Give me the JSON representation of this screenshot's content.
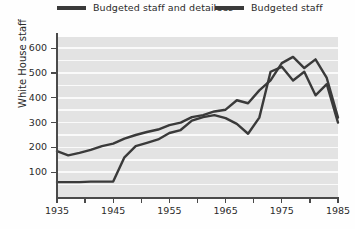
{
  "chart_data": {
    "type": "line",
    "title": "",
    "xlabel": "",
    "ylabel": "White House staff",
    "xlim": [
      1935,
      1985
    ],
    "ylim": [
      0,
      650
    ],
    "xticks": [
      1935,
      1945,
      1955,
      1965,
      1975,
      1985
    ],
    "xtick_labels": [
      "1935",
      "1945",
      "1955",
      "1965",
      "1975",
      "1985"
    ],
    "yticks": [
      100,
      200,
      300,
      400,
      500,
      600
    ],
    "ytick_labels": [
      "100",
      "200",
      "300",
      "400",
      "500",
      "600"
    ],
    "grid": "horizontal",
    "legend_position": "top",
    "background": "#e3e3e3",
    "gridline_color": "#fafafa",
    "line_color": "#3a3a3a",
    "series": [
      {
        "name": "Budgeted staff and detailees",
        "x": [
          1935,
          1937,
          1939,
          1941,
          1943,
          1945,
          1947,
          1949,
          1951,
          1953,
          1955,
          1957,
          1959,
          1961,
          1963,
          1965,
          1967,
          1969,
          1971,
          1973,
          1975,
          1977,
          1979,
          1981,
          1983,
          1985
        ],
        "values": [
          185,
          168,
          178,
          190,
          205,
          215,
          235,
          250,
          262,
          272,
          290,
          300,
          322,
          330,
          345,
          352,
          390,
          378,
          430,
          470,
          540,
          565,
          520,
          555,
          480,
          320
        ]
      },
      {
        "name": "Budgeted staff",
        "x": [
          1935,
          1937,
          1939,
          1941,
          1943,
          1945,
          1947,
          1949,
          1951,
          1953,
          1955,
          1957,
          1959,
          1961,
          1963,
          1965,
          1967,
          1969,
          1971,
          1973,
          1975,
          1977,
          1979,
          1981,
          1983,
          1985
        ],
        "values": [
          60,
          60,
          60,
          62,
          62,
          62,
          160,
          205,
          218,
          232,
          258,
          270,
          308,
          322,
          330,
          318,
          295,
          255,
          320,
          505,
          525,
          470,
          505,
          410,
          455,
          300
        ]
      }
    ]
  },
  "legend": {
    "items": [
      {
        "label": "Budgeted staff and detailees"
      },
      {
        "label": "Budgeted staff"
      }
    ]
  },
  "axes": {
    "y_title": "White House staff"
  }
}
